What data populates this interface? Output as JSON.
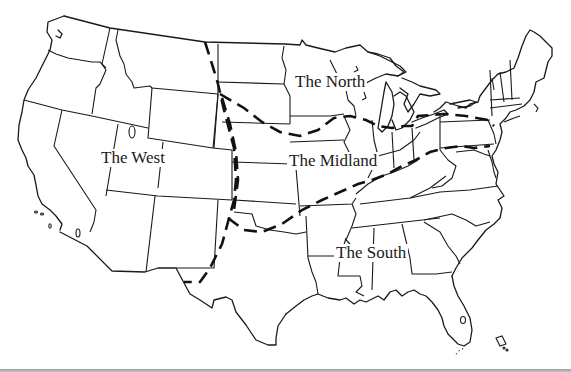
{
  "map": {
    "type": "dialect-regions-map",
    "subject": "United States dialect regions",
    "colors": {
      "outline": "#1a1a1a",
      "dialect_boundary": "#111111",
      "background": "#ffffff",
      "bottom_rule": "#9a9a9a"
    },
    "regions": [
      {
        "id": "north",
        "label": "The North"
      },
      {
        "id": "midland",
        "label": "The Midland"
      },
      {
        "id": "south",
        "label": "The South"
      },
      {
        "id": "west",
        "label": "The West"
      }
    ],
    "boundaries": [
      {
        "id": "west-boundary",
        "style": "dashed",
        "separates": "The West from The North/Midland/South"
      },
      {
        "id": "north-midland-boundary",
        "style": "dashed",
        "separates": "The North from The Midland"
      },
      {
        "id": "midland-south-boundary",
        "style": "dashed",
        "separates": "The Midland from The South"
      }
    ]
  }
}
